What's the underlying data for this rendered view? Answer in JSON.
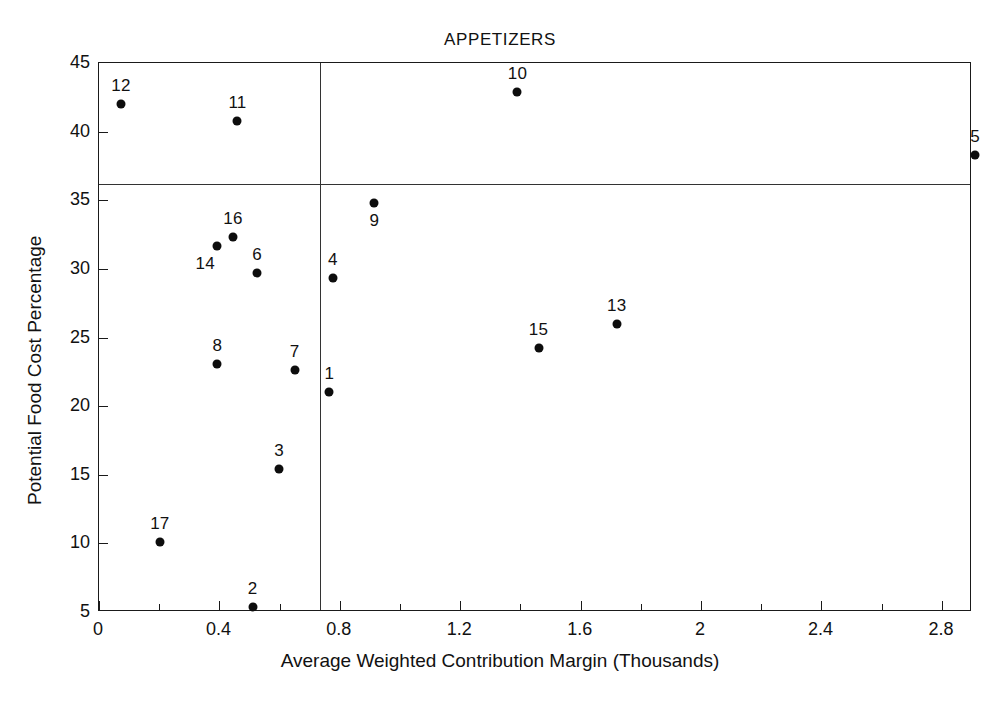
{
  "chart_data": {
    "type": "scatter",
    "title": "APPETIZERS",
    "xlabel": "Average Weighted Contribution Margin (Thousands)",
    "ylabel": "Potential Food Cost Percentage",
    "xlim": [
      0,
      2.9
    ],
    "ylim": [
      5,
      45
    ],
    "grid": false,
    "legend": "none",
    "xticks": [
      0,
      0.4,
      0.8,
      1.2,
      1.6,
      2,
      2.4,
      2.8
    ],
    "xtick_labels": [
      "0",
      "0.4",
      "0.8",
      "1.2",
      "1.6",
      "2",
      "2.4",
      "2.8"
    ],
    "xminor_ticks": [
      0.2,
      0.6,
      1.0,
      1.4,
      1.8,
      2.2,
      2.6
    ],
    "yticks": [
      5,
      10,
      15,
      20,
      25,
      30,
      35,
      40,
      45
    ],
    "ytick_labels": [
      "5",
      "10",
      "15",
      "20",
      "25",
      "30",
      "35",
      "40",
      "45"
    ],
    "reference_lines": {
      "horizontal_y": 36.2,
      "vertical_x": 0.735
    },
    "point_color": "#0d0d0d",
    "points": [
      {
        "label": "1",
        "x": 0.765,
        "y": 21.0,
        "label_dx": 0,
        "label_dy": 1.9
      },
      {
        "label": "2",
        "x": 0.51,
        "y": 5.4,
        "label_dx": 0,
        "label_dy": 1.9
      },
      {
        "label": "3",
        "x": 0.598,
        "y": 15.4,
        "label_dx": 0,
        "label_dy": 1.9
      },
      {
        "label": "4",
        "x": 0.777,
        "y": 29.3,
        "label_dx": 0,
        "label_dy": 1.9
      },
      {
        "label": "5",
        "x": 2.91,
        "y": 38.3,
        "label_dx": 0,
        "label_dy": 1.9
      },
      {
        "label": "6",
        "x": 0.525,
        "y": 29.7,
        "label_dx": 0,
        "label_dy": 1.9
      },
      {
        "label": "7",
        "x": 0.65,
        "y": 22.6,
        "label_dx": 0,
        "label_dy": 1.9
      },
      {
        "label": "8",
        "x": 0.393,
        "y": 23.1,
        "label_dx": 0,
        "label_dy": 1.9
      },
      {
        "label": "9",
        "x": 0.915,
        "y": 34.8,
        "label_dx": 0,
        "label_dy": -1.9
      },
      {
        "label": "10",
        "x": 1.39,
        "y": 42.9,
        "label_dx": 0,
        "label_dy": 1.9
      },
      {
        "label": "11",
        "x": 0.46,
        "y": 40.8,
        "label_dx": 0,
        "label_dy": 1.9
      },
      {
        "label": "12",
        "x": 0.073,
        "y": 42.0,
        "label_dx": 0,
        "label_dy": 1.9
      },
      {
        "label": "13",
        "x": 1.72,
        "y": 26.0,
        "label_dx": 0,
        "label_dy": 1.9
      },
      {
        "label": "14",
        "x": 0.393,
        "y": 31.7,
        "label_dx": -0.04,
        "label_dy": -1.9
      },
      {
        "label": "15",
        "x": 1.46,
        "y": 24.2,
        "label_dx": 0,
        "label_dy": 1.9
      },
      {
        "label": "16",
        "x": 0.445,
        "y": 32.3,
        "label_dx": 0,
        "label_dy": 1.9
      },
      {
        "label": "17",
        "x": 0.202,
        "y": 10.1,
        "label_dx": 0,
        "label_dy": 1.9
      }
    ]
  }
}
